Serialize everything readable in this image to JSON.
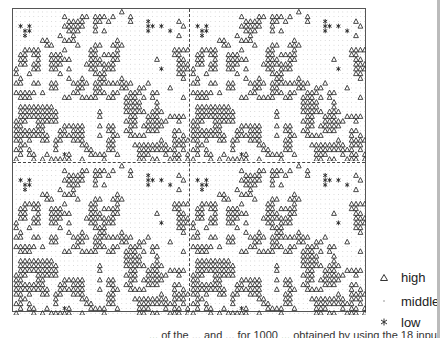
{
  "chart_data": {
    "type": "scatter",
    "title": "",
    "xlabel": "",
    "ylabel": "",
    "grid": false,
    "layout": "2x2 grid of class maps (identical panels)",
    "legend_position": "bottom-right",
    "legend": [
      {
        "key": "H",
        "label": "high",
        "symbol": "triangle"
      },
      {
        "key": "M",
        "label": "middle",
        "symbol": "dot"
      },
      {
        "key": "L",
        "label": "low",
        "symbol": "asterisk"
      }
    ],
    "cols": 40,
    "rows": 32,
    "grid_rows": [
      "MMMMMMMMMMMMMMMMMMMMMMMMHMMMMMMMMMMMMMMM",
      "MMMMMMMMMMMHMMMHHMHHHMHMMMHMMMMMMMMMMMMM",
      "MMMMMMMMMMMMHHHHMMHHMHMMMMHMMMLMMMMMMHMM",
      "MLMLMMMMMMMHHHHHMMHMMMMMMMMMMMLLMLMMMMHM",
      "MMLLMMMMMMMMHHHMMMHMHMMMMMMMMMLMMMMLMMMM",
      "MMLMMMMMMMHMMHMMMMMMMMMMMMMMMMMMMMMMMHMM",
      "MMMMMMHHMMMHHHMMMMMMMMMHMMMMMMMMMMMMMMMM",
      "MMMMMMMHHMMMMMHMMMHHMMHHHMMMMMMMMMMMMMMM",
      "MMHHHHMMMMMHMMMMMHHMMMMHMMMMMMMMMMMMHHHH",
      "MHHMHHMMHHHMMMMMMHHMHHHHMMMMMMMMMMMMHHMM",
      "MHHMMHMMHHHHHMMMMHHHMMHHMMMMMMMMHMMMMHHM",
      "MHHMHHMMHHHMMMMMHHHHHHHMMMMMMMMMMMMMMHHH",
      "HMMMHHMMHHMMHMMMMHHMHHHMMMMMMMMMMLMMMHHH",
      "HMMHMMMMMMHMMMMMMMHHHMMMMMMMMMMMMMMMMHHM",
      "MHMMMMMMMMMMHMMHMMMHHMMMHMMMMMMMMMMMMMHM",
      "HHMMHHMMHHMMMHHHHMHHHHHHHHHMMMHMMMMMMMMM",
      "MMMMMMMMHHMMMMHHMMHHMMMMHHMMHHMMMMMHMMMM",
      "HHHHHMHMMMMMMHHMMMHHHMHHMMHHHMMHHMMMMMMM",
      "MHHHMMMMMMMHHMMHHHHMMHHMMHHHMHMHMMMMMMHM",
      "MMMMMMMMMMMMMMMMMMMMMMMMMHHHHMMMHMMMMMMM",
      "MHHHHHHHHMMMMMMMMMMMMMMMMHHHHMMMHMMMMMMM",
      "MHHHHHHHHHMMMMMMMMMHMMMMMHHHHHMHHHMMMMMM",
      "MHHHHHHHHHMMMMMMMMMHMMMMMMHHMMHHHMMHHHHM",
      "HHHMMHHHHHMMMMMMMMMMMMMMMHHHMMHHHHHMMHMM",
      "HHMMMHHMMMMHHHHHMMMHMHHMMMHHMHHHHHMMMMMM",
      "HHHHHHHMMMHHMHHHMMMMMHHMMHHMMMHHHMMMHHMM",
      "HHHHHHHHMMHHHHHHMMMHMMHHMMHHHHMMMMMMHMHM",
      "HHMHMMHHMHHMMHHHMMMMMHHMMMMMMMMMMHMMHHHH",
      "MHHMMMMMMHMMMMMHHMMMMHHMMMMHHHHHHHHMHHHM",
      "HHMHMMMMMHMMMMMMHHMMMHHMMMMMHHHHHHHHHMHM",
      "MHMHHMMHMMMLHMMMMHHHHMMHMMMMHHHMMMHMHHMH",
      "HMMMHMHMHHHHHMMHMMMMHMMMMMMMHHMHHMMHHHMH"
    ],
    "panels": 4
  },
  "legend": {
    "items": [
      {
        "symbol": "triangle-icon",
        "label": "high"
      },
      {
        "symbol": "dot-icon",
        "label": "middle"
      },
      {
        "symbol": "asterisk-icon",
        "label": "low"
      }
    ]
  },
  "caption": {
    "text": "... of the ... and ... for 1000 ... obtained by using the 18 input"
  }
}
